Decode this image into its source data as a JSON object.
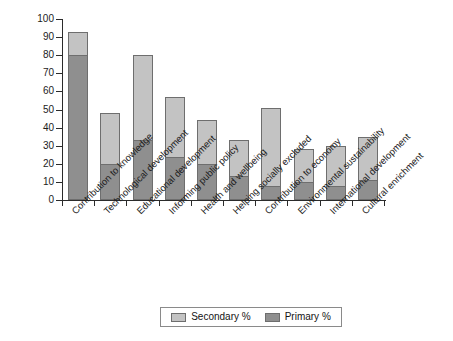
{
  "chart_data": {
    "type": "bar",
    "stacked": true,
    "title": "",
    "subtitle": "",
    "xlabel": "",
    "ylabel": "",
    "ylim": [
      0,
      100
    ],
    "ytick_step": 10,
    "yticks": [
      0,
      10,
      20,
      30,
      40,
      50,
      60,
      70,
      80,
      90,
      100
    ],
    "grid": false,
    "legend_position": "bottom-center",
    "categories": [
      "Contribution to knowledge",
      "Technological development",
      "Educational development",
      "Informing public policy",
      "Health and wellbeing",
      "Helping socially excluded",
      "Contribution to economy",
      "Environmental sustainability",
      "International development",
      "Cultural enrichment"
    ],
    "series": [
      {
        "name": "Primary %",
        "color": "#8f8f8f",
        "values": [
          80,
          20,
          33,
          24,
          20,
          13,
          8,
          10,
          8,
          11
        ]
      },
      {
        "name": "Secondary %",
        "color": "#c3c3c3",
        "values": [
          13,
          28,
          47,
          33,
          24,
          20,
          43,
          18,
          22,
          24
        ]
      }
    ],
    "totals": [
      93,
      48,
      80,
      57,
      44,
      33,
      51,
      28,
      30,
      35
    ]
  },
  "legend": {
    "entries": [
      {
        "label": "Secondary %",
        "swatch": "secondary"
      },
      {
        "label": "Primary %",
        "swatch": "primary"
      }
    ]
  }
}
